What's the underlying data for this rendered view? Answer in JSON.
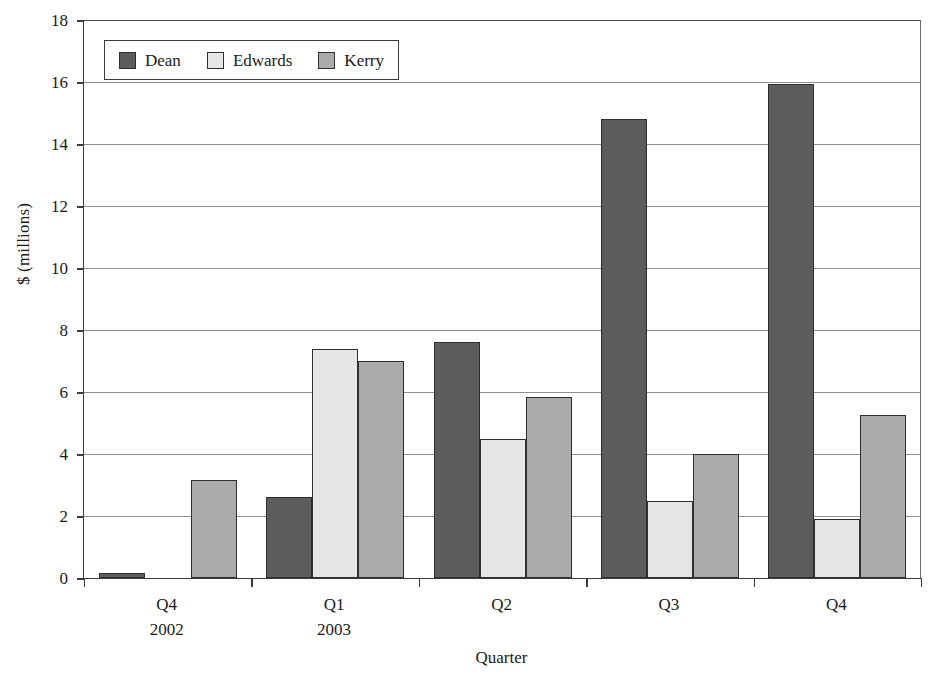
{
  "chart_data": {
    "type": "bar",
    "title": "",
    "xlabel": "Quarter",
    "ylabel": "$ (millions)",
    "ylim": [
      0,
      18
    ],
    "ytick_step": 2,
    "yticks": [
      18,
      16,
      14,
      12,
      10,
      8,
      6,
      4,
      2,
      0
    ],
    "grid": true,
    "legend_position": "top-left-inside",
    "categories": [
      "Q4\n2002",
      "Q1\n2003",
      "Q2",
      "Q3",
      "Q4"
    ],
    "category_lines": [
      {
        "line1": "Q4",
        "line2": "2002"
      },
      {
        "line1": "Q1",
        "line2": "2003"
      },
      {
        "line1": "Q2",
        "line2": ""
      },
      {
        "line1": "Q3",
        "line2": ""
      },
      {
        "line1": "Q4",
        "line2": ""
      }
    ],
    "series": [
      {
        "name": "Dean",
        "color": "#5c5c5c",
        "values": [
          0.15,
          2.6,
          7.6,
          14.8,
          15.95
        ]
      },
      {
        "name": "Edwards",
        "color": "#e6e6e6",
        "values": [
          0.0,
          7.4,
          4.5,
          2.5,
          1.9
        ]
      },
      {
        "name": "Kerry",
        "color": "#ababab",
        "values": [
          3.15,
          7.0,
          5.85,
          4.0,
          5.25
        ]
      }
    ]
  },
  "legend": {
    "entries": [
      {
        "label": "Dean",
        "color": "#5c5c5c"
      },
      {
        "label": "Edwards",
        "color": "#e6e6e6"
      },
      {
        "label": "Kerry",
        "color": "#ababab"
      }
    ]
  },
  "axes": {
    "y_title": "$ (millions)",
    "x_title": "Quarter"
  }
}
